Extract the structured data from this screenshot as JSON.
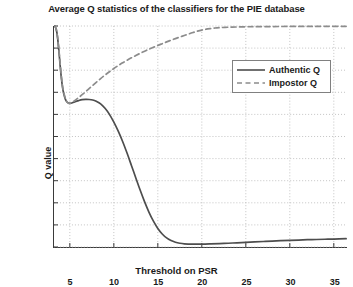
{
  "chart_data": {
    "type": "line",
    "title": "Average Q statistics of the classifiers for the PIE database",
    "xlabel": "Threshold on PSR",
    "ylabel": "Q value",
    "xlim": [
      3.2,
      36.5
    ],
    "ylim": [
      -1,
      1
    ],
    "xticks": [
      5,
      10,
      15,
      20,
      25,
      30,
      35
    ],
    "yticks": [
      -1,
      -0.8,
      -0.6,
      -0.4,
      -0.2,
      0,
      0.2,
      0.4,
      0.6,
      0.8,
      1
    ],
    "xtick_labels": [
      "5",
      "10",
      "15",
      "20",
      "25",
      "30",
      "35"
    ],
    "ytick_labels": [
      "1",
      "0.8",
      "0.6",
      "0.4",
      "0.2",
      "0",
      "-0.2",
      "-0.4",
      "-0.6",
      "-0.8",
      "-1"
    ],
    "grid": true,
    "grid_style": "dotted",
    "grid_color": "#b4b4b4",
    "legend_position": "upper right",
    "series": [
      {
        "name": "Authentic Q",
        "style": "solid",
        "color": "#4d4d4d",
        "points": [
          [
            3.3,
            1.0
          ],
          [
            3.45,
            0.97
          ],
          [
            3.6,
            0.9
          ],
          [
            3.75,
            0.78
          ],
          [
            3.9,
            0.64
          ],
          [
            4.05,
            0.52
          ],
          [
            4.2,
            0.43
          ],
          [
            4.4,
            0.36
          ],
          [
            4.6,
            0.32
          ],
          [
            4.8,
            0.305
          ],
          [
            5.0,
            0.3
          ],
          [
            5.3,
            0.305
          ],
          [
            5.6,
            0.315
          ],
          [
            6.0,
            0.325
          ],
          [
            6.4,
            0.333
          ],
          [
            6.8,
            0.336
          ],
          [
            7.2,
            0.335
          ],
          [
            7.6,
            0.33
          ],
          [
            8.0,
            0.318
          ],
          [
            8.5,
            0.295
          ],
          [
            9.0,
            0.255
          ],
          [
            9.5,
            0.2
          ],
          [
            10.0,
            0.13
          ],
          [
            10.5,
            0.048
          ],
          [
            11.0,
            -0.045
          ],
          [
            11.5,
            -0.15
          ],
          [
            12.0,
            -0.262
          ],
          [
            12.5,
            -0.375
          ],
          [
            13.0,
            -0.487
          ],
          [
            13.5,
            -0.592
          ],
          [
            14.0,
            -0.686
          ],
          [
            14.5,
            -0.766
          ],
          [
            15.0,
            -0.832
          ],
          [
            15.5,
            -0.882
          ],
          [
            16.0,
            -0.918
          ],
          [
            16.5,
            -0.942
          ],
          [
            17.0,
            -0.957
          ],
          [
            17.5,
            -0.966
          ],
          [
            18.0,
            -0.971
          ],
          [
            19.0,
            -0.974
          ],
          [
            20.0,
            -0.974
          ],
          [
            21.0,
            -0.972
          ],
          [
            22.0,
            -0.969
          ],
          [
            23.0,
            -0.966
          ],
          [
            24.0,
            -0.962
          ],
          [
            25.0,
            -0.958
          ],
          [
            26.0,
            -0.954
          ],
          [
            27.0,
            -0.95
          ],
          [
            28.0,
            -0.946
          ],
          [
            29.0,
            -0.943
          ],
          [
            30.0,
            -0.94
          ],
          [
            31.0,
            -0.937
          ],
          [
            32.0,
            -0.934
          ],
          [
            33.0,
            -0.932
          ],
          [
            34.0,
            -0.93
          ],
          [
            35.0,
            -0.928
          ],
          [
            36.4,
            -0.925
          ]
        ]
      },
      {
        "name": "Impostor Q",
        "style": "dashed",
        "color": "#8c8c8c",
        "points": [
          [
            3.3,
            1.0
          ],
          [
            3.45,
            0.97
          ],
          [
            3.6,
            0.9
          ],
          [
            3.75,
            0.79
          ],
          [
            3.9,
            0.66
          ],
          [
            4.05,
            0.54
          ],
          [
            4.2,
            0.44
          ],
          [
            4.4,
            0.37
          ],
          [
            4.6,
            0.325
          ],
          [
            4.8,
            0.305
          ],
          [
            5.0,
            0.3
          ],
          [
            5.5,
            0.322
          ],
          [
            6.0,
            0.352
          ],
          [
            6.5,
            0.385
          ],
          [
            7.0,
            0.42
          ],
          [
            7.5,
            0.455
          ],
          [
            8.0,
            0.49
          ],
          [
            8.5,
            0.524
          ],
          [
            9.0,
            0.556
          ],
          [
            9.5,
            0.586
          ],
          [
            10.0,
            0.615
          ],
          [
            10.5,
            0.642
          ],
          [
            11.0,
            0.667
          ],
          [
            11.5,
            0.69
          ],
          [
            12.0,
            0.712
          ],
          [
            12.5,
            0.733
          ],
          [
            13.0,
            0.753
          ],
          [
            13.5,
            0.772
          ],
          [
            14.0,
            0.79
          ],
          [
            14.5,
            0.807
          ],
          [
            15.0,
            0.824
          ],
          [
            15.5,
            0.84
          ],
          [
            16.0,
            0.856
          ],
          [
            16.5,
            0.871
          ],
          [
            17.0,
            0.886
          ],
          [
            17.5,
            0.9
          ],
          [
            18.0,
            0.914
          ],
          [
            18.5,
            0.928
          ],
          [
            19.0,
            0.941
          ],
          [
            19.5,
            0.953
          ],
          [
            20.0,
            0.963
          ],
          [
            20.5,
            0.971
          ],
          [
            21.0,
            0.977
          ],
          [
            21.5,
            0.982
          ],
          [
            22.0,
            0.985
          ],
          [
            23.0,
            0.989
          ],
          [
            24.0,
            0.991
          ],
          [
            25.0,
            0.993
          ],
          [
            26.0,
            0.994
          ],
          [
            28.0,
            0.995
          ],
          [
            30.0,
            0.996
          ],
          [
            32.0,
            0.996
          ],
          [
            34.0,
            0.997
          ],
          [
            36.4,
            0.997
          ]
        ]
      }
    ]
  }
}
